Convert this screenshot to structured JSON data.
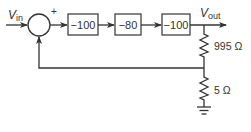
{
  "diagram": {
    "type": "feedback-block-diagram",
    "input_label": {
      "main": "V",
      "sub": "in"
    },
    "output_label": {
      "main": "V",
      "sub": "out"
    },
    "summing_junction": {
      "sign_forward": "+"
    },
    "blocks": [
      {
        "gain": "−100"
      },
      {
        "gain": "−80"
      },
      {
        "gain": "−100"
      }
    ],
    "feedback_network": {
      "resistors": [
        {
          "value": "995 Ω"
        },
        {
          "value": "5 Ω"
        }
      ],
      "ground": true
    },
    "colors": {
      "line": "#333333",
      "background": "#ffffff"
    }
  }
}
